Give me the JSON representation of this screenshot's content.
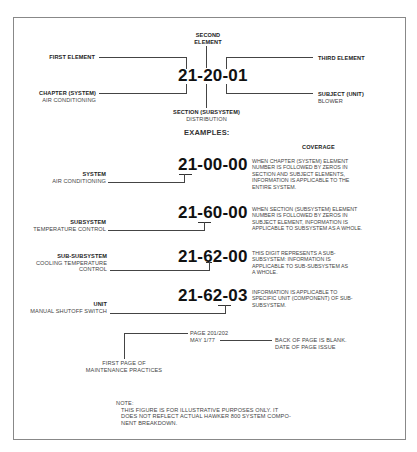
{
  "top": {
    "code": "21-20-01",
    "second_element": [
      "SECOND",
      "ELEMENT"
    ],
    "first_element": "FIRST ELEMENT",
    "third_element": "THIRD ELEMENT",
    "chapter": {
      "title": "CHAPTER (SYSTEM)",
      "sub": "AIR CONDITIONING"
    },
    "section": {
      "title": "SECTION (SUBSYSTEM)",
      "sub": "DISTRIBUTION"
    },
    "subject": {
      "title": "SUBJECT (UNIT)",
      "sub": "BLOWER"
    }
  },
  "examples_heading": "EXAMPLES:",
  "coverage_heading": "COVERAGE",
  "examples": [
    {
      "code": "21-00-00",
      "label_title": "SYSTEM",
      "label_sub": [
        "AIR CONDITIONING"
      ],
      "coverage": [
        "WHEN CHAPTER (SYSTEM) ELEMENT",
        "NUMBER IS FOLLOWED BY ZEROS IN",
        "SECTION AND SUBJECT ELEMENTS,",
        "INFORMATION IS APPLICABLE TO THE",
        "ENTIRE SYSTEM."
      ]
    },
    {
      "code": "21-60-00",
      "label_title": "SUBSYSTEM",
      "label_sub": [
        "TEMPERATURE CONTROL"
      ],
      "coverage": [
        "WHEN SECTION (SUBSYSTEM) ELEMENT",
        "NUMBER IS FOLLOWED BY ZEROS IN",
        "SUBJECT ELEMENT, INFORMATION IS",
        "APPLICABLE TO SUBSYSTEM AS A WHOLE."
      ]
    },
    {
      "code": "21-62-00",
      "label_title": "SUB-SUBSYSTEM",
      "label_sub": [
        "COOLING TEMPERATURE",
        "CONTROL"
      ],
      "coverage": [
        "THIS DIGIT REPRESENTS A SUB-",
        "SUBSYSTEM: INFORMATION IS",
        "APPLICABLE TO SUB-SUBSYSTEM AS",
        "A WHOLE."
      ]
    },
    {
      "code": "21-62-03",
      "label_title": "UNIT",
      "label_sub": [
        "MANUAL SHUTOFF SWITCH"
      ],
      "coverage": [
        "INFORMATION IS APPLICABLE TO",
        "SPECIFIC UNIT (COMPONENT) OF SUB-",
        "SUBSYSTEM."
      ]
    }
  ],
  "page_info": {
    "page": "PAGE 201/202",
    "date": "MAY 1/77",
    "back_of_page": [
      "BACK OF PAGE IS BLANK.",
      "DATE OF PAGE ISSUE"
    ],
    "first_page": [
      "FIRST PAGE OF",
      "MAINTENANCE PRACTICES"
    ]
  },
  "note": {
    "title": "NOTE:",
    "lines": [
      "THIS FIGURE IS FOR ILLUSTRATIVE PURPOSES ONLY. IT",
      "DOES NOT REFLECT ACTUAL HAWKER 800 SYSTEM COMPO-",
      "NENT BREAKDOWN."
    ]
  }
}
